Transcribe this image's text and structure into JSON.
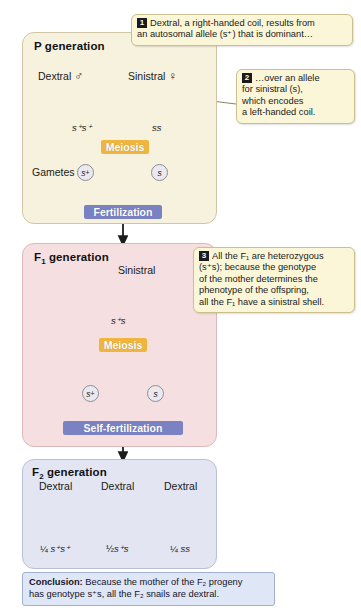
{
  "generations": [
    {
      "id": "p",
      "title_main": "P generation",
      "title_label": "P",
      "title_sub": "",
      "title_rest": " generation",
      "parents": [
        {
          "phenotype": "Dextral",
          "sex_symbol": "♂",
          "genotype_main": "s",
          "genotype_sup": "+",
          "genotype_tail": "s",
          "genotype_tail_sup": "+",
          "genotype_text": "s⁺s⁺",
          "shell_icon": "dextral-snail-shell"
        },
        {
          "phenotype": "Sinistral",
          "sex_symbol": "♀",
          "genotype_text": "ss",
          "shell_icon": "sinistral-snail-shell"
        }
      ],
      "process_1": "Meiosis",
      "gametes_label": "Gametes",
      "gametes": [
        {
          "allele": "s",
          "sup": "+"
        },
        {
          "allele": "s",
          "sup": ""
        }
      ],
      "process_2": "Fertilization"
    },
    {
      "id": "f1",
      "title_label": "F",
      "title_sub": "1",
      "title_rest": " generation",
      "offspring": {
        "phenotype": "Sinistral",
        "genotype_text": "s⁺s",
        "shell_icon": "sinistral-snail-shell"
      },
      "process_1": "Meiosis",
      "gametes": [
        {
          "allele": "s",
          "sup": "+"
        },
        {
          "allele": "s",
          "sup": ""
        }
      ],
      "process_2": "Self-fertilization"
    },
    {
      "id": "f2",
      "title_label": "F",
      "title_sub": "2",
      "title_rest": " generation",
      "offspring": [
        {
          "phenotype": "Dextral",
          "ratio": "¼",
          "genotype_text": "s⁺s⁺",
          "shell_icon": "dextral-snail-shell"
        },
        {
          "phenotype": "Dextral",
          "ratio": "½",
          "genotype_text": "s⁺s",
          "shell_icon": "dextral-snail-shell"
        },
        {
          "phenotype": "Dextral",
          "ratio": "¼",
          "genotype_text": "ss",
          "shell_icon": "dextral-snail-shell"
        }
      ]
    }
  ],
  "callouts": [
    {
      "number": "1",
      "line_1": "Dextral, a right-handed coil, results from",
      "line_2": "an autosomal allele (s⁺) that is dominant…"
    },
    {
      "number": "2",
      "line_1": "…over an allele",
      "line_2": "for sinistral (s),",
      "line_3": "which encodes",
      "line_4": "a left-handed coil."
    },
    {
      "number": "3",
      "line_1": "All the F₁ are heterozygous",
      "line_2": "(s⁺s); because the genotype",
      "line_3": "of the mother determines the",
      "line_4": "phenotype of the offspring,",
      "line_5": "all the F₁ have a sinistral shell."
    }
  ],
  "conclusion": {
    "label": "Conclusion:",
    "text_1": " Because the mother of the F₂ progeny",
    "text_2": "has genotype s⁺s, all the F₂ snails are dextral."
  },
  "colors": {
    "p_panel": "#f7f2dd",
    "f1_panel": "#f6dfe0",
    "f2_panel": "#e3e6f2",
    "meiosis_band": "#efb53f",
    "fertilization_band": "#7b82c4",
    "callout_bg": "#fbf6d8",
    "conclusion_bg": "#dfe6f5",
    "shell_brown": "#b08c46",
    "shell_cream": "#e8e4dc"
  }
}
